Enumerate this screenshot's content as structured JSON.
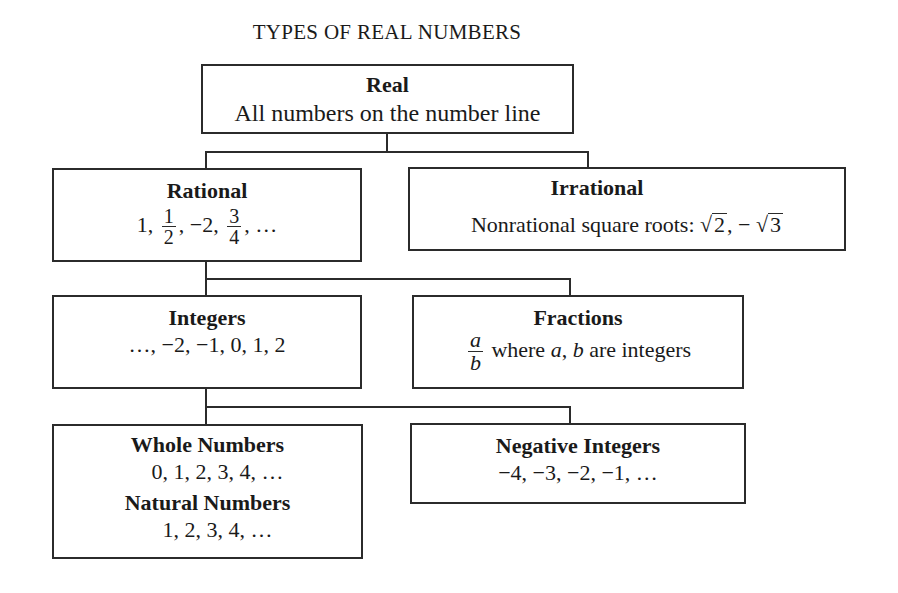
{
  "title": "TYPES OF REAL NUMBERS",
  "nodes": {
    "real": {
      "label": "Real",
      "description": "All numbers on the number line"
    },
    "rational": {
      "label": "Rational",
      "examples": {
        "a": "1,",
        "f1_num": "1",
        "f1_den": "2",
        "b": ", −2,",
        "f2_num": "3",
        "f2_den": "4",
        "c": ", …"
      }
    },
    "irrational": {
      "label": "Irrational",
      "prefix": "Nonrational square roots:",
      "root1": "2",
      "sep": ", −",
      "root2": "3",
      "radical_symbol": "√"
    },
    "integers": {
      "label": "Integers",
      "examples": "…, −2, −1, 0, 1, 2"
    },
    "fractions": {
      "label": "Fractions",
      "frac_num": "a",
      "frac_den": "b",
      "text_where": "where",
      "var_a": "a",
      "comma": ",",
      "var_b": "b",
      "text_rest": "are integers"
    },
    "whole": {
      "label": "Whole Numbers",
      "examples": "0, 1, 2, 3, 4, …"
    },
    "natural": {
      "label": "Natural Numbers",
      "examples": "1, 2, 3, 4, …"
    },
    "negative": {
      "label": "Negative Integers",
      "examples": "−4, −3, −2, −1, …"
    }
  },
  "edges": [
    [
      "real",
      "rational"
    ],
    [
      "real",
      "irrational"
    ],
    [
      "rational",
      "integers"
    ],
    [
      "rational",
      "fractions"
    ],
    [
      "integers",
      "whole"
    ],
    [
      "integers",
      "negative"
    ]
  ],
  "colors": {
    "line": "#2b2b2b",
    "text": "#1a1a1a",
    "background": "#ffffff"
  }
}
